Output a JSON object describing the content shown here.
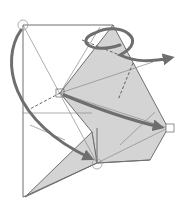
{
  "diagram": {
    "type": "origami-fold-diagram",
    "colors": {
      "background": "#ffffff",
      "paper_edge": "#6f6f6f",
      "crease": "#8a8a8a",
      "flap_fill": "#d4d4d4",
      "arrow": "#6e6e6e"
    },
    "markers": [
      {
        "name": "top-left-circle-marker",
        "shape": "circle"
      },
      {
        "name": "center-square-marker",
        "shape": "square"
      },
      {
        "name": "right-square-marker",
        "shape": "square"
      },
      {
        "name": "bottom-circle-marker",
        "shape": "circle"
      }
    ],
    "arrows": [
      {
        "name": "fold-arrow-left-curve",
        "from": "top-left",
        "to": "bottom-circle"
      },
      {
        "name": "fold-arrow-top-loop",
        "direction": "right"
      },
      {
        "name": "fold-arrow-center-to-right",
        "from": "center-square",
        "to": "right-square"
      }
    ]
  }
}
